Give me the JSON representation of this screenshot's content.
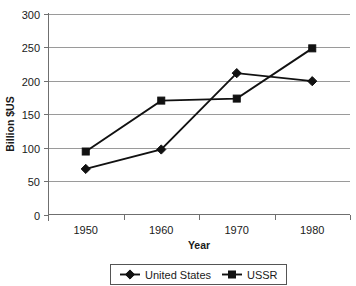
{
  "chart_data": {
    "type": "line",
    "title": "",
    "xlabel": "Year",
    "ylabel": "Billion $US",
    "categories": [
      "1950",
      "1960",
      "1970",
      "1980"
    ],
    "x": [
      1950,
      1960,
      1970,
      1980
    ],
    "ylim": [
      0,
      300
    ],
    "yticks": [
      0,
      50,
      100,
      150,
      200,
      250,
      300
    ],
    "ytick_labels": [
      "0",
      "50",
      "100",
      "150",
      "200",
      "250",
      "300"
    ],
    "grid": "horizontal",
    "legend_position": "bottom-center",
    "series": [
      {
        "name": "United States",
        "marker": "diamond",
        "color": "#111111",
        "values": [
          68,
          97,
          211,
          199
        ]
      },
      {
        "name": "USSR",
        "marker": "square",
        "color": "#111111",
        "values": [
          94,
          170,
          173,
          248
        ]
      }
    ]
  },
  "axes": {
    "y_axis_title": "Billion $US",
    "x_axis_title": "Year"
  },
  "legend": {
    "items": [
      {
        "label": "United States",
        "marker": "diamond-marker"
      },
      {
        "label": "USSR",
        "marker": "square-marker"
      }
    ]
  }
}
